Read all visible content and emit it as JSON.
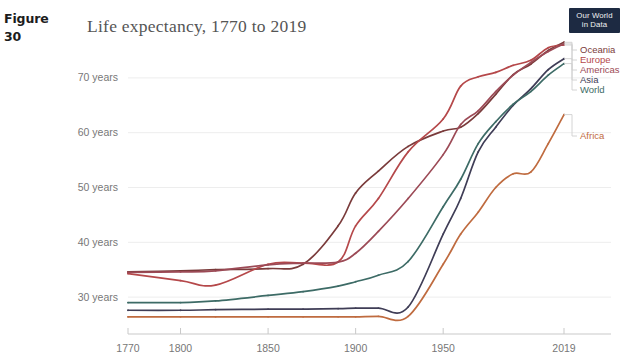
{
  "figure": {
    "label": "Figure",
    "number": "30"
  },
  "logo": {
    "line1": "Our World",
    "line2": "in Data"
  },
  "chart_data": {
    "type": "line",
    "title": "Life expectancy, 1770 to 2019",
    "xlabel": "",
    "ylabel": "",
    "xlim": [
      1770,
      2019
    ],
    "ylim": [
      24,
      76
    ],
    "grid": true,
    "legend_position": "right",
    "x_ticks": [
      "1770",
      "1800",
      "1850",
      "1900",
      "1950",
      "2019"
    ],
    "x_tick_values": [
      1770,
      1800,
      1850,
      1900,
      1950,
      2019
    ],
    "y_ticks": [
      "30 years",
      "40 years",
      "50 years",
      "60 years",
      "70 years"
    ],
    "y_tick_values": [
      30,
      40,
      50,
      60,
      70
    ],
    "colors": {
      "Oceania": "#7a3b3b",
      "Europe": "#b5484a",
      "Americas": "#9c4a56",
      "Asia": "#3f3d56",
      "World": "#3d6b66",
      "Africa": "#bf6b3f"
    },
    "series": [
      {
        "name": "Oceania",
        "color": "#7a3b3b",
        "x": [
          1770,
          1800,
          1820,
          1850,
          1870,
          1890,
          1900,
          1913,
          1930,
          1950,
          1960,
          1970,
          1980,
          1990,
          2000,
          2010,
          2019
        ],
        "values": [
          34.6,
          34.8,
          35.0,
          35.2,
          36.0,
          43.0,
          49.0,
          53.0,
          57.5,
          60.3,
          61.0,
          63.5,
          67.0,
          70.6,
          72.5,
          75.0,
          76.5
        ]
      },
      {
        "name": "Europe",
        "color": "#b5484a",
        "x": [
          1770,
          1800,
          1820,
          1850,
          1870,
          1890,
          1900,
          1913,
          1930,
          1950,
          1960,
          1970,
          1980,
          1990,
          2000,
          2010,
          2019
        ],
        "values": [
          34.3,
          33.0,
          32.2,
          36.0,
          36.2,
          36.4,
          43.0,
          48.0,
          56.5,
          62.5,
          68.5,
          70.2,
          71.0,
          72.3,
          73.2,
          75.5,
          76.0
        ]
      },
      {
        "name": "Americas",
        "color": "#9c4a56",
        "x": [
          1770,
          1800,
          1820,
          1850,
          1870,
          1890,
          1900,
          1913,
          1930,
          1950,
          1960,
          1970,
          1980,
          1990,
          2000,
          2010,
          2019
        ],
        "values": [
          34.5,
          34.6,
          34.8,
          35.9,
          36.2,
          36.4,
          38.0,
          42.0,
          48.0,
          56.0,
          61.5,
          64.0,
          67.5,
          70.5,
          72.8,
          74.8,
          76.2
        ]
      },
      {
        "name": "Asia",
        "color": "#3f3d56",
        "x": [
          1770,
          1800,
          1820,
          1850,
          1870,
          1890,
          1900,
          1913,
          1930,
          1950,
          1960,
          1970,
          1980,
          1990,
          2000,
          2010,
          2019
        ],
        "values": [
          27.6,
          27.6,
          27.7,
          27.8,
          27.8,
          27.9,
          28.0,
          28.0,
          28.2,
          41.5,
          48.0,
          56.5,
          61.0,
          65.0,
          68.0,
          71.5,
          73.5
        ]
      },
      {
        "name": "World",
        "color": "#3d6b66",
        "x": [
          1770,
          1800,
          1820,
          1850,
          1870,
          1890,
          1900,
          1913,
          1930,
          1950,
          1960,
          1970,
          1980,
          1990,
          2000,
          2010,
          2019
        ],
        "values": [
          29.0,
          29.0,
          29.3,
          30.3,
          31.0,
          32.0,
          32.8,
          34.0,
          36.5,
          46.5,
          51.5,
          58.0,
          62.0,
          65.2,
          67.5,
          70.5,
          72.6
        ]
      },
      {
        "name": "Africa",
        "color": "#bf6b3f",
        "x": [
          1770,
          1800,
          1820,
          1850,
          1870,
          1890,
          1900,
          1913,
          1930,
          1950,
          1960,
          1970,
          1980,
          1990,
          2000,
          2010,
          2019
        ],
        "values": [
          26.4,
          26.4,
          26.4,
          26.4,
          26.4,
          26.4,
          26.4,
          26.5,
          26.5,
          36.0,
          41.5,
          45.5,
          50.0,
          52.5,
          52.8,
          58.0,
          63.3
        ]
      }
    ],
    "legend": [
      {
        "label": "Oceania",
        "color": "#7a3b3b"
      },
      {
        "label": "Europe",
        "color": "#b5484a"
      },
      {
        "label": "Americas",
        "color": "#9c4a56"
      },
      {
        "label": "Asia",
        "color": "#3f3d56"
      },
      {
        "label": "World",
        "color": "#3d6b66"
      },
      {
        "label": "Africa",
        "color": "#bf6b3f"
      }
    ]
  }
}
